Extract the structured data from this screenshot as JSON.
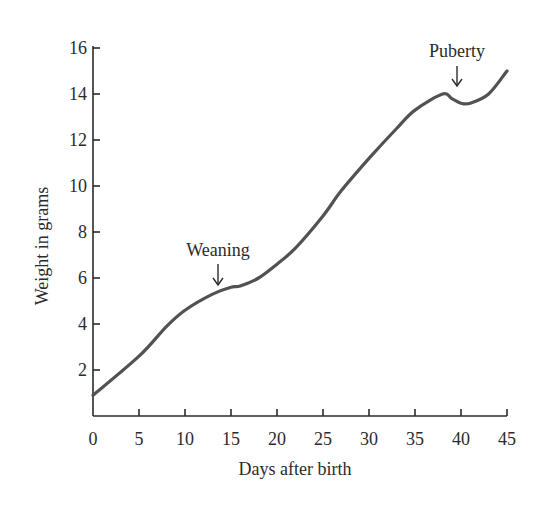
{
  "chart_data": {
    "type": "line",
    "title": "",
    "xlabel": "Days after birth",
    "ylabel": "Weight in grams",
    "xlim": [
      0,
      45
    ],
    "ylim": [
      0,
      16
    ],
    "x_ticks": [
      0,
      5,
      10,
      15,
      20,
      25,
      30,
      35,
      40,
      45
    ],
    "y_ticks": [
      2,
      4,
      6,
      8,
      10,
      12,
      14,
      16
    ],
    "grid": false,
    "legend": null,
    "series": [
      {
        "name": "Weight",
        "x": [
          0,
          5,
          8,
          10,
          13,
          15,
          16,
          18,
          20,
          22,
          25,
          27,
          30,
          33,
          35,
          38,
          39,
          40,
          41,
          43,
          45
        ],
        "values": [
          0.9,
          2.6,
          3.9,
          4.6,
          5.3,
          5.6,
          5.65,
          6.0,
          6.6,
          7.3,
          8.7,
          9.8,
          11.2,
          12.5,
          13.3,
          14.0,
          13.8,
          13.6,
          13.6,
          14.0,
          15.0
        ]
      }
    ],
    "annotations": [
      {
        "text": "Weaning",
        "x": 13.5,
        "y": 5.5,
        "arrow": "down"
      },
      {
        "text": "Puberty",
        "x": 39,
        "y": 14.0,
        "arrow": "down"
      }
    ]
  },
  "labels": {
    "xlabel": "Days after birth",
    "ylabel": "Weight in grams",
    "weaning": "Weaning",
    "puberty": "Puberty"
  }
}
